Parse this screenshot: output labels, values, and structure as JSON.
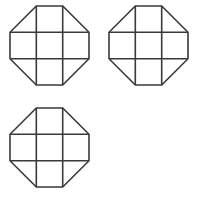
{
  "figure": {
    "background_color": "#ffffff",
    "stroke_color": "#3a3a3a",
    "stroke_width": 1.6,
    "canvas": {
      "width": 199,
      "height": 197
    },
    "shape_count": 3,
    "layout": {
      "arrangement": "2x2 grid with bottom-right cell empty",
      "columns": 2,
      "rows": 2,
      "occupied_cells": [
        "top-left",
        "top-right",
        "bottom-left"
      ],
      "empty_cells": [
        "bottom-right"
      ]
    },
    "shape_description": {
      "type": "octagon",
      "construction": "square subdivided into a 3x3 grid with the four corner cells' outer corners cut by diagonals",
      "internal_grid": "3x3",
      "vertical_divider_count": 2,
      "horizontal_divider_count": 2,
      "corner_cuts": 4,
      "sides": 8,
      "filled": false
    },
    "shapes": [
      {
        "name": "octagon-top-left",
        "position": "top-left",
        "x": 10,
        "y": 6,
        "size": 79,
        "corner_cut": 26.3
      },
      {
        "name": "octagon-top-right",
        "position": "top-right",
        "x": 109,
        "y": 6,
        "size": 79,
        "corner_cut": 26.3
      },
      {
        "name": "octagon-bottom-left",
        "position": "bottom-left",
        "x": 10,
        "y": 108,
        "size": 79,
        "corner_cut": 26.3
      }
    ]
  }
}
